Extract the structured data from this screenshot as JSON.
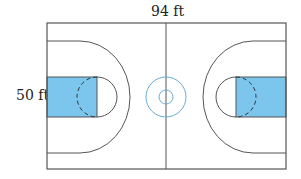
{
  "labels": {
    "length": "94 ft",
    "width": "50 ft"
  },
  "colors": {
    "line": "#555555",
    "key_fill": "#7cc6ee",
    "center_circle": "#6aaed6",
    "background": "#ffffff"
  },
  "court": {
    "outline": {
      "x": 47,
      "y": 23,
      "w": 239,
      "h": 146
    },
    "center_x": 166,
    "center_y": 97,
    "center_circle_outer_r": 20,
    "center_circle_inner_r": 7
  }
}
